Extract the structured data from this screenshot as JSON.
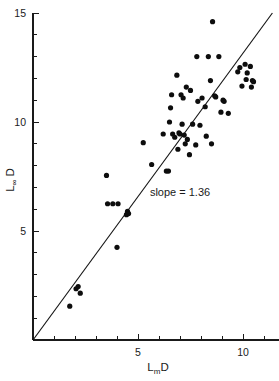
{
  "chart_data": {
    "type": "scatter",
    "title": "",
    "subtitle": "",
    "xlabel": "LmD",
    "xlabel_base": "L",
    "xlabel_subscript": "m",
    "xlabel_suffix": "D",
    "ylabel": "L∞D",
    "ylabel_base": "L",
    "ylabel_subscript": "∞",
    "ylabel_suffix": "D",
    "xlim": [
      0,
      11.7
    ],
    "ylim": [
      0,
      15
    ],
    "xticks": [
      5,
      10
    ],
    "xticklabels": [
      "5",
      "10"
    ],
    "x_minor_ticks": [
      1,
      2,
      3,
      4,
      6,
      7,
      8,
      9,
      11
    ],
    "yticks": [
      5,
      10,
      15
    ],
    "yticklabels": [
      "5",
      "10",
      "15"
    ],
    "y_minor_ticks": [
      1,
      2,
      3,
      4,
      6,
      7,
      8,
      9,
      11,
      12,
      13,
      14
    ],
    "grid": false,
    "legend": null,
    "annotations": [
      {
        "text": "slope = 1.36",
        "x": 7.0,
        "y": 6.6
      }
    ],
    "fit_line": {
      "slope": 1.36,
      "intercept": 0,
      "x_start": 0,
      "y_start": 0,
      "x_end": 11.4,
      "y_end": 15.0,
      "color": "#141414"
    },
    "marker": {
      "shape": "circle",
      "radius_px": 2.6,
      "color": "#0d0d0d"
    },
    "series": [
      {
        "name": "observations",
        "points": [
          [
            1.75,
            1.55
          ],
          [
            2.05,
            2.35
          ],
          [
            2.15,
            2.45
          ],
          [
            2.25,
            2.15
          ],
          [
            3.5,
            7.55
          ],
          [
            3.55,
            6.25
          ],
          [
            3.8,
            6.25
          ],
          [
            4.0,
            4.25
          ],
          [
            4.05,
            6.25
          ],
          [
            4.45,
            5.75
          ],
          [
            4.5,
            5.9
          ],
          [
            4.55,
            5.8
          ],
          [
            5.25,
            9.05
          ],
          [
            5.65,
            8.05
          ],
          [
            6.2,
            9.45
          ],
          [
            6.35,
            7.75
          ],
          [
            6.45,
            7.75
          ],
          [
            6.5,
            10.0
          ],
          [
            6.55,
            10.65
          ],
          [
            6.6,
            11.25
          ],
          [
            6.65,
            9.45
          ],
          [
            6.75,
            9.3
          ],
          [
            6.85,
            12.15
          ],
          [
            6.9,
            8.75
          ],
          [
            6.95,
            9.5
          ],
          [
            7.0,
            9.45
          ],
          [
            7.05,
            11.25
          ],
          [
            7.1,
            9.9
          ],
          [
            7.15,
            11.1
          ],
          [
            7.2,
            9.4
          ],
          [
            7.25,
            9.0
          ],
          [
            7.3,
            11.6
          ],
          [
            7.35,
            9.2
          ],
          [
            7.45,
            8.5
          ],
          [
            7.5,
            11.45
          ],
          [
            7.6,
            9.9
          ],
          [
            7.75,
            8.95
          ],
          [
            7.8,
            13.0
          ],
          [
            7.85,
            10.95
          ],
          [
            7.95,
            9.85
          ],
          [
            8.05,
            11.1
          ],
          [
            8.2,
            10.7
          ],
          [
            8.25,
            9.35
          ],
          [
            8.35,
            13.0
          ],
          [
            8.45,
            11.9
          ],
          [
            8.5,
            9.0
          ],
          [
            8.55,
            14.6
          ],
          [
            8.65,
            11.2
          ],
          [
            8.7,
            11.15
          ],
          [
            8.85,
            13.0
          ],
          [
            8.95,
            10.45
          ],
          [
            9.05,
            11.0
          ],
          [
            9.1,
            10.95
          ],
          [
            9.3,
            10.4
          ],
          [
            9.75,
            12.3
          ],
          [
            9.85,
            12.5
          ],
          [
            9.95,
            11.65
          ],
          [
            10.1,
            12.65
          ],
          [
            10.15,
            11.95
          ],
          [
            10.2,
            12.25
          ],
          [
            10.35,
            12.55
          ],
          [
            10.4,
            11.6
          ],
          [
            10.45,
            11.9
          ],
          [
            10.5,
            11.85
          ]
        ]
      }
    ]
  }
}
